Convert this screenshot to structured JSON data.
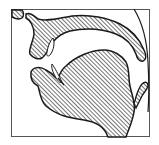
{
  "diagram": {
    "type": "sagittal-vocal-tract",
    "colors": {
      "background": "#ffffff",
      "outline": "#1a1a1a",
      "hatch": "#2a2a2a",
      "frame": "#555555"
    },
    "parts": [
      {
        "name": "upper-lip",
        "label": ""
      },
      {
        "name": "upper-jaw-palate",
        "label": ""
      },
      {
        "name": "upper-teeth",
        "label": ""
      },
      {
        "name": "lower-teeth",
        "label": ""
      },
      {
        "name": "tongue-lower-jaw",
        "label": ""
      },
      {
        "name": "epiglottis",
        "label": ""
      },
      {
        "name": "pharynx-wall",
        "label": ""
      }
    ]
  }
}
